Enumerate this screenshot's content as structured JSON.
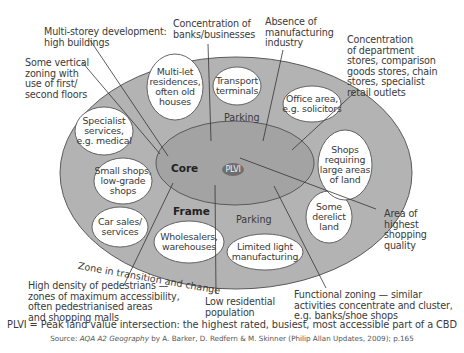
{
  "diagram": {
    "zones": {
      "core_label": "Core",
      "frame_label": "Frame",
      "plvi_label": "PLVI",
      "parking_top": "Parking",
      "parking_bottom": "Parking",
      "zone_transition": "Zone in transition  and change"
    },
    "bubbles": {
      "multi_let": [
        "Multi-let",
        "residences,",
        "often old",
        "houses"
      ],
      "transport": [
        "Transport",
        "terminals"
      ],
      "office": [
        "Office area,",
        "e.g. solicitors"
      ],
      "specialist": [
        "Specialist",
        "services,",
        "e.g. medical"
      ],
      "small_shops": [
        "Small shops,",
        "low-grade",
        "shops"
      ],
      "car_sales": [
        "Car sales/",
        "services"
      ],
      "wholesalers": [
        "Wholesalers,",
        "warehouses"
      ],
      "light_manufacturing": [
        "Limited light",
        "manufacturing"
      ],
      "derelict": [
        "Some",
        "derelict",
        "land"
      ],
      "large_shops": [
        "Shops",
        "requiring",
        "large areas",
        "of land"
      ]
    },
    "callouts": {
      "multi_storey": [
        "Multi-storey development:",
        "high buildings"
      ],
      "banks": [
        "Concentration of",
        "banks/businesses"
      ],
      "manufacturing": [
        "Absence of",
        "manufacturing",
        "industry"
      ],
      "department": [
        "Concentration",
        "of department",
        "stores, comparison",
        "goods stores, chain",
        "stores, specialist",
        "retail outlets"
      ],
      "vertical": [
        "Some vertical",
        "zoning with",
        "use of first/",
        "second floors"
      ],
      "highest_shopping": [
        "Area of",
        "highest",
        "shopping",
        "quality"
      ],
      "pedestrians": [
        "High density of pedestrians —",
        "zones of maximum accessibility,",
        "often pedestrianised areas",
        "and shopping malls"
      ],
      "low_residential": [
        "Low residential",
        "population"
      ],
      "functional": [
        "Functional zoning — similar",
        "activities concentrate and cluster,",
        "e.g. banks/shoe shops"
      ]
    },
    "footer": {
      "definition": "PLVI = Peak land value intersection: the highest rated, busiest, most accessible part of a CBD",
      "source_prefix": "Source: ",
      "source_title": "AQA A2 Geography",
      "source_rest": " by A. Barker, D. Redfern & M. Skinner (Philip Allan Updates, 2009); p.165"
    },
    "colors": {
      "frame_fill": "#b3b3b3",
      "core_fill": "#a3a3a3",
      "plvi_fill": "#6e6e6e",
      "bubble_fill": "#ffffff",
      "outline": "#555555"
    }
  }
}
